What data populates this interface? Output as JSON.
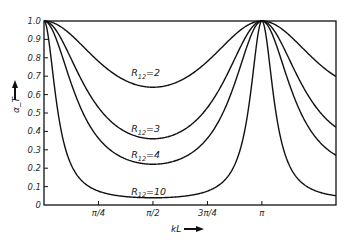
{
  "chart_data": {
    "type": "line",
    "title": "",
    "xlabel": "kL",
    "ylabel": "α_T",
    "xlim": [
      0,
      4.21
    ],
    "ylim": [
      0,
      1.0
    ],
    "grid": false,
    "legend": "inline labels",
    "x_ticks": [
      {
        "value": 0.7854,
        "label": "π/4"
      },
      {
        "value": 1.5708,
        "label": "π/2"
      },
      {
        "value": 2.3562,
        "label": "3π/4"
      },
      {
        "value": 3.1416,
        "label": "π"
      }
    ],
    "y_ticks": [
      {
        "value": 0,
        "label": "0"
      },
      {
        "value": 0.1,
        "label": "0.1"
      },
      {
        "value": 0.2,
        "label": "0.2"
      },
      {
        "value": 0.3,
        "label": "0.3"
      },
      {
        "value": 0.4,
        "label": "0.4"
      },
      {
        "value": 0.5,
        "label": "0.5"
      },
      {
        "value": 0.6,
        "label": "0.6"
      },
      {
        "value": 0.7,
        "label": "0.7"
      },
      {
        "value": 0.8,
        "label": "0.8"
      },
      {
        "value": 0.9,
        "label": "0.9"
      },
      {
        "value": 1.0,
        "label": "1.0"
      }
    ],
    "series": [
      {
        "name": "R12=2",
        "label_main": "R",
        "label_sub": "12",
        "label_val": "=2",
        "R": 2,
        "min_at_pi_over_2": 0.64,
        "label_x": 0.4,
        "label_y": 0.7
      },
      {
        "name": "R12=3",
        "label_main": "R",
        "label_sub": "12",
        "label_val": "=3",
        "R": 3,
        "min_at_pi_over_2": 0.36,
        "label_x": 0.4,
        "label_y": 0.395
      },
      {
        "name": "R12=4",
        "label_main": "R",
        "label_sub": "12",
        "label_val": "=4",
        "R": 4,
        "min_at_pi_over_2": 0.22,
        "label_x": 0.4,
        "label_y": 0.255
      },
      {
        "name": "R12=10",
        "label_main": "R",
        "label_sub": "12",
        "label_val": "=10",
        "R": 10,
        "min_at_pi_over_2": 0.04,
        "label_x": 0.4,
        "label_y": 0.055
      }
    ],
    "formula": "α_T = 1 / (cos²(kL) + ((R + 1/R)/2)² sin²(kL))",
    "peak": {
      "x_label": "π",
      "value": 1.0
    }
  },
  "colors": {
    "line": "#111111",
    "frame": "#111111",
    "background": "#ffffff"
  }
}
